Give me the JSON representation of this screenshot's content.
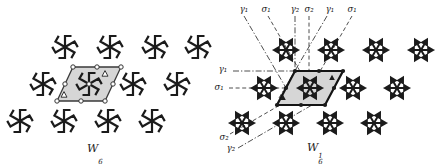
{
  "figure": {
    "background": "#ffffff",
    "ink": "#1b1b1b",
    "axis_line_color": "#3a3a3a",
    "cell_fill": "#d6d6d6",
    "left_panel": {
      "caption": {
        "base": "W",
        "sub": "6",
        "sup": ""
      },
      "motif_icon": "pinwheel-6-icon",
      "motif_positions": [
        [
          65,
          47
        ],
        [
          110,
          47
        ],
        [
          155,
          47
        ],
        [
          198,
          47
        ],
        [
          43,
          84
        ],
        [
          89,
          84
        ],
        [
          133,
          84
        ],
        [
          177,
          84
        ],
        [
          20,
          121
        ],
        [
          64,
          121
        ],
        [
          108,
          121
        ],
        [
          152,
          121
        ]
      ],
      "unit_cell": {
        "polygon": [
          [
            73,
            67
          ],
          [
            121,
            67
          ],
          [
            105,
            101
          ],
          [
            57,
            101
          ]
        ],
        "marker_style": "open-circle",
        "center": [
          89,
          84
        ],
        "has_center_circle": true,
        "triangle_style": "open",
        "triangle_positions": [
          [
            105,
            74
          ],
          [
            64,
            95
          ]
        ]
      }
    },
    "right_panel": {
      "caption": {
        "base": "W",
        "sub": "6",
        "sup": "1"
      },
      "motif_icon": "arrow-star-6-icon",
      "motif_positions": [
        [
          286,
          50
        ],
        [
          331,
          50
        ],
        [
          376,
          50
        ],
        [
          421,
          50
        ],
        [
          264,
          88
        ],
        [
          310,
          88
        ],
        [
          353,
          88
        ],
        [
          397,
          88
        ],
        [
          242,
          123
        ],
        [
          286,
          123
        ],
        [
          330,
          123
        ],
        [
          374,
          123
        ]
      ],
      "unit_cell": {
        "polygon": [
          [
            295,
            71
          ],
          [
            343,
            71
          ],
          [
            325,
            105
          ],
          [
            277,
            105
          ]
        ],
        "marker_style": "filled-circle",
        "center": [
          310,
          88
        ],
        "has_center_circle": false,
        "triangle_style": "filled",
        "triangle_positions": [
          [
            332,
            78
          ],
          [
            283,
            98
          ]
        ]
      },
      "axes": [
        {
          "label": "γ₁",
          "label_pos": [
            244,
            12
          ],
          "line": [
            244,
            16,
            296,
            105
          ],
          "style": "dashdot"
        },
        {
          "label": "σ₁",
          "label_pos": [
            266,
            12
          ],
          "line": [
            268,
            16,
            319,
            104
          ],
          "style": "dashed"
        },
        {
          "label": "γ₂",
          "label_pos": [
            295,
            12
          ],
          "line": [
            295,
            16,
            295,
            103
          ],
          "style": "dashdot"
        },
        {
          "label": "σ₂",
          "label_pos": [
            309,
            12
          ],
          "line": [
            309,
            16,
            309,
            103
          ],
          "style": "dashed"
        },
        {
          "label": "γ₁",
          "label_pos": [
            330,
            12
          ],
          "line": [
            327,
            16,
            279,
            98
          ],
          "style": "dashdot"
        },
        {
          "label": "σ₁",
          "label_pos": [
            352,
            12
          ],
          "line": [
            352,
            16,
            300,
            106
          ],
          "style": "dashed"
        },
        {
          "label": "γ₁",
          "label_pos": [
            223,
            72
          ],
          "line": [
            233,
            71,
            296,
            71
          ],
          "style": "dashdot"
        },
        {
          "label": "σ₁",
          "label_pos": [
            219,
            90
          ],
          "line": [
            229,
            88,
            336,
            88
          ],
          "style": "dashed"
        },
        {
          "label": "σ₂",
          "label_pos": [
            224,
            140
          ],
          "line": [
            230,
            134,
            318,
            83
          ],
          "style": "dashed"
        },
        {
          "label": "γ₂",
          "label_pos": [
            231,
            151
          ],
          "line": [
            238,
            148,
            312,
            105
          ],
          "style": "dashdot"
        }
      ]
    }
  }
}
